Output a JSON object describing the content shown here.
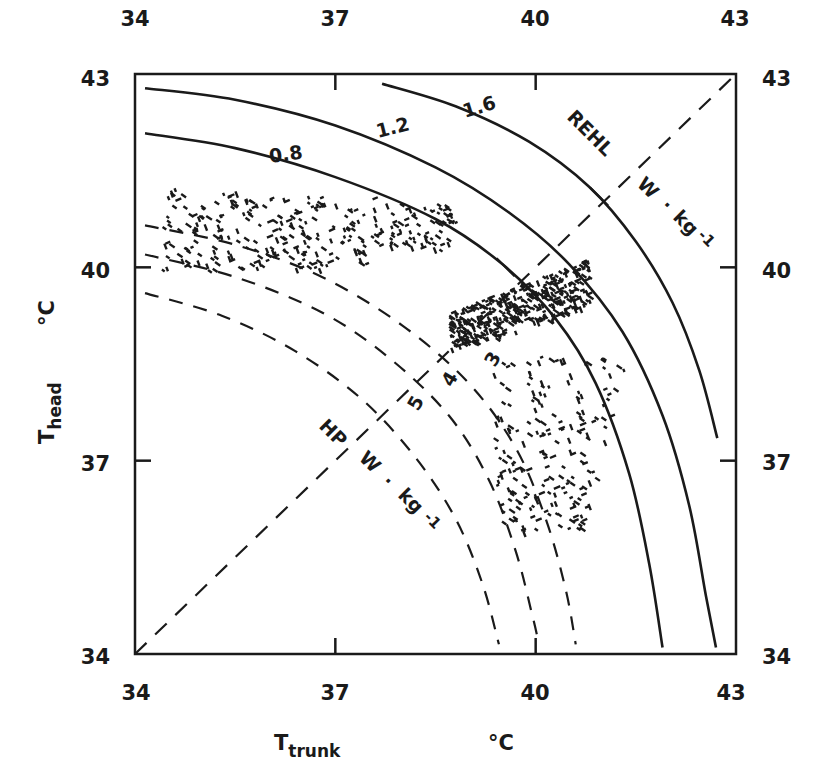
{
  "chart_data": {
    "type": "scatter",
    "title": "",
    "xlabel": "T_trunk",
    "xlabel_main": "T",
    "xlabel_sub": "trunk",
    "xunit": "°C",
    "ylabel": "T_head",
    "ylabel_main": "T",
    "ylabel_sub": "head",
    "yunit": "°C",
    "xlim": [
      34,
      43
    ],
    "ylim": [
      34,
      43
    ],
    "grid": false,
    "legend": null,
    "x_ticks": [
      34,
      37,
      40,
      43
    ],
    "y_ticks": [
      34,
      37,
      40,
      43
    ],
    "x_tick_labels": [
      "34",
      "37",
      "40",
      "43"
    ],
    "y_tick_labels": [
      "34",
      "37",
      "40",
      "43"
    ],
    "diagonal": {
      "style": "dashed",
      "from": [
        34,
        34
      ],
      "to": [
        43,
        43
      ]
    },
    "rehl_curves": {
      "label_group": "REHL",
      "unit": "W · kg⁻¹",
      "style": "solid",
      "series": [
        {
          "name": "0.8",
          "points": [
            [
              34.15,
              42.08
            ],
            [
              35.5,
              41.85
            ],
            [
              37.0,
              41.4
            ],
            [
              38.5,
              40.75
            ],
            [
              39.5,
              40.05
            ],
            [
              40.3,
              39.2
            ],
            [
              40.9,
              38.2
            ],
            [
              41.4,
              36.8
            ],
            [
              41.7,
              35.4
            ],
            [
              41.9,
              34.1
            ]
          ]
        },
        {
          "name": "1.2",
          "points": [
            [
              34.15,
              42.78
            ],
            [
              35.5,
              42.6
            ],
            [
              37.0,
              42.2
            ],
            [
              38.5,
              41.55
            ],
            [
              39.6,
              40.85
            ],
            [
              40.5,
              40.05
            ],
            [
              41.3,
              39.0
            ],
            [
              41.9,
              37.7
            ],
            [
              42.3,
              36.3
            ],
            [
              42.55,
              34.9
            ],
            [
              42.7,
              34.1
            ]
          ]
        },
        {
          "name": "1.6",
          "points": [
            [
              37.7,
              42.85
            ],
            [
              38.8,
              42.5
            ],
            [
              39.9,
              41.95
            ],
            [
              40.8,
              41.25
            ],
            [
              41.5,
              40.4
            ],
            [
              42.05,
              39.45
            ],
            [
              42.45,
              38.4
            ],
            [
              42.72,
              37.35
            ]
          ]
        }
      ]
    },
    "hp_curves": {
      "label_group": "HP",
      "unit": "W · kg⁻¹",
      "style": "dashed",
      "series": [
        {
          "name": "3",
          "points": [
            [
              34.15,
              40.65
            ],
            [
              35.5,
              40.35
            ],
            [
              36.8,
              39.85
            ],
            [
              38.0,
              39.1
            ],
            [
              39.0,
              38.2
            ],
            [
              39.7,
              37.2
            ],
            [
              40.15,
              36.1
            ],
            [
              40.45,
              35.0
            ],
            [
              40.6,
              34.15
            ]
          ]
        },
        {
          "name": "4",
          "points": [
            [
              34.15,
              40.2
            ],
            [
              35.5,
              39.85
            ],
            [
              36.8,
              39.3
            ],
            [
              37.8,
              38.6
            ],
            [
              38.7,
              37.7
            ],
            [
              39.3,
              36.7
            ],
            [
              39.7,
              35.6
            ],
            [
              39.95,
              34.6
            ],
            [
              40.05,
              34.15
            ]
          ]
        },
        {
          "name": "5",
          "points": [
            [
              34.15,
              39.6
            ],
            [
              35.3,
              39.25
            ],
            [
              36.4,
              38.7
            ],
            [
              37.4,
              37.95
            ],
            [
              38.2,
              37.05
            ],
            [
              38.8,
              36.1
            ],
            [
              39.2,
              35.1
            ],
            [
              39.45,
              34.15
            ]
          ]
        }
      ]
    },
    "scatter_clusters": [
      {
        "name": "cluster-upper-left",
        "x_range": [
          34.4,
          38.8
        ],
        "y_range": [
          39.9,
          41.3
        ],
        "approx_count": 300
      },
      {
        "name": "cluster-dense-center",
        "x_range": [
          38.7,
          40.8
        ],
        "y_range": [
          38.6,
          40.1
        ],
        "approx_count": 400
      },
      {
        "name": "cluster-lower-tail",
        "x_range": [
          39.3,
          41.5
        ],
        "y_range": [
          35.9,
          38.6
        ],
        "approx_count": 200
      }
    ]
  },
  "labels": {
    "rehl": "REHL",
    "rehl_unit_w": "W",
    "rehl_unit_dot": "·",
    "rehl_unit_kg": "kg",
    "rehl_unit_exp": "-1",
    "hp": "HP",
    "hp_unit_w": "W",
    "hp_unit_dot": "·",
    "hp_unit_kg": "kg",
    "hp_unit_exp": "-1",
    "curve_08": "0.8",
    "curve_12": "1.2",
    "curve_16": "1.6",
    "curve_3": "3",
    "curve_4": "4",
    "curve_5": "5"
  },
  "colors": {
    "ink": "#1a1a1a",
    "background": "#ffffff"
  }
}
